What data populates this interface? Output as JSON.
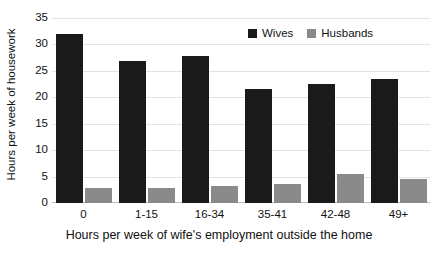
{
  "chart_data": {
    "type": "bar",
    "title": "",
    "xlabel": "Hours per week of wife's employment outside the home",
    "ylabel": "Hours per week of housework",
    "categories": [
      "0",
      "1-15",
      "16-34",
      "35-41",
      "42-48",
      "49+"
    ],
    "series": [
      {
        "name": "Wives",
        "color": "#1a1a1a",
        "values": [
          32.0,
          26.8,
          27.8,
          21.5,
          22.5,
          23.4
        ]
      },
      {
        "name": "Husbands",
        "color": "#8a8a8a",
        "values": [
          2.9,
          2.8,
          3.3,
          3.6,
          5.5,
          4.5
        ]
      }
    ],
    "ylim": [
      0,
      35
    ],
    "yticks": [
      0,
      5,
      10,
      15,
      20,
      25,
      30,
      35
    ],
    "ytick_labels": [
      "0",
      "5",
      "10",
      "15",
      "20",
      "25",
      "30",
      "35"
    ],
    "grid": true,
    "legend_position": "top-right",
    "legend": [
      "Wives",
      "Husbands"
    ],
    "background_color": "#ffffff",
    "gridline_color": "#e2e2e2"
  }
}
